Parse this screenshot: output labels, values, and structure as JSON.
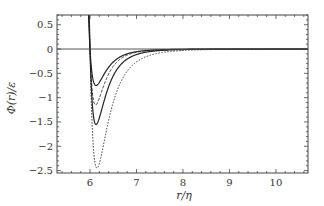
{
  "chart_data": {
    "type": "line",
    "title": "",
    "xlabel": "r/η",
    "ylabel": "Φ(r)/ε",
    "xlim": [
      5.29,
      10.69
    ],
    "ylim": [
      -2.55,
      0.7
    ],
    "xticks": [
      6,
      7,
      8,
      9,
      10
    ],
    "xtick_labels": [
      "6",
      "7",
      "8",
      "9",
      "10"
    ],
    "yticks": [
      0.5,
      0,
      -0.5,
      -1,
      -1.5,
      -2,
      -2.5
    ],
    "ytick_labels": [
      "0.5",
      "0",
      "-0.5",
      "-1",
      "-1.5",
      "-2",
      "-2.5"
    ],
    "grid": false,
    "legend": null,
    "reference_line": {
      "y": 0,
      "style": "solid"
    },
    "series": [
      {
        "name": "curve-1",
        "style": "solid",
        "r_zero": 6.0,
        "min_r": 6.13,
        "min_value": -0.75
      },
      {
        "name": "curve-2",
        "style": "dashed",
        "r_zero": 6.0,
        "min_r": 6.12,
        "min_value": -1.15
      },
      {
        "name": "curve-3",
        "style": "solid",
        "r_zero": 6.0,
        "min_r": 6.13,
        "min_value": -1.55
      },
      {
        "name": "curve-4",
        "style": "dotted",
        "r_zero": 6.0,
        "min_r": 6.15,
        "min_value": -2.45
      }
    ]
  }
}
